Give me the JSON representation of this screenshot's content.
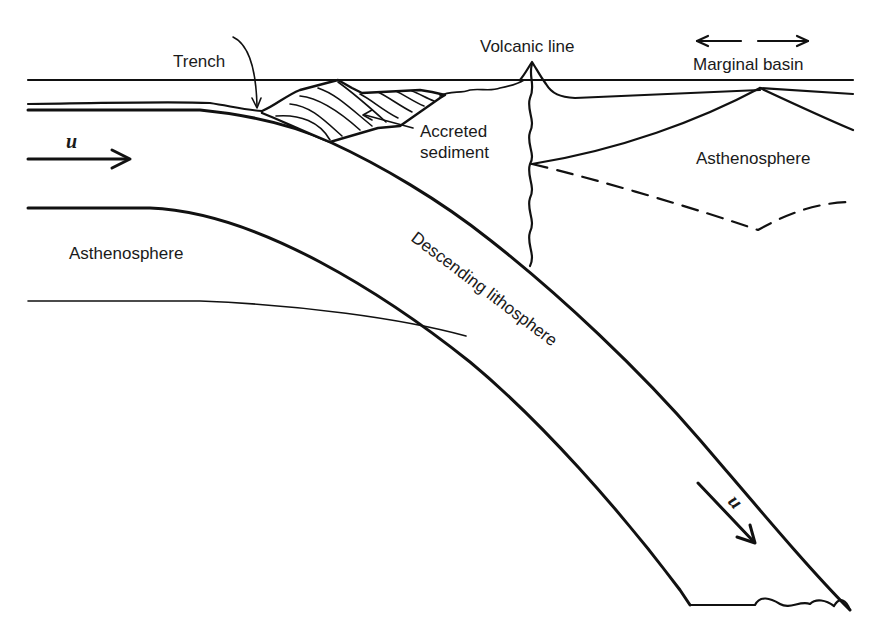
{
  "diagram": {
    "type": "subduction-zone-cross-section",
    "labels": {
      "trench": "Trench",
      "volcanic_line": "Volcanic line",
      "marginal_basin": "Marginal basin",
      "accreted_sediment_line1": "Accreted",
      "accreted_sediment_line2": "sediment",
      "asthenosphere_left": "Asthenosphere",
      "asthenosphere_right": "Asthenosphere",
      "descending_lithosphere": "Descending lithosphere",
      "velocity_left": "u",
      "velocity_slab": "u"
    },
    "arrows": [
      {
        "name": "plate-velocity-arrow",
        "direction": "right",
        "label": "u"
      },
      {
        "name": "slab-velocity-arrow",
        "direction": "down-right",
        "label": "u"
      },
      {
        "name": "marginal-basin-spreading-arrows",
        "direction": "left-and-right"
      }
    ],
    "colors": {
      "ink": "#111111",
      "background": "#ffffff"
    }
  }
}
